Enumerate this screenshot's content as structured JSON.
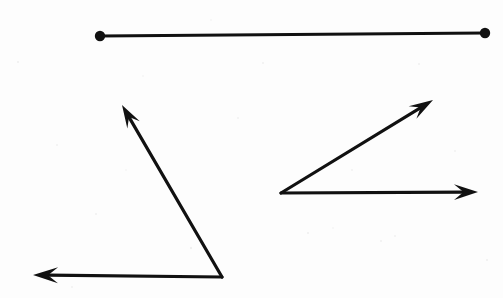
{
  "document": {
    "title": "Geometric figures: one line segment and two angles",
    "background_color": "#fdfdfd",
    "ink_color": "#111111",
    "width": 503,
    "height": 298,
    "stroke_width": 3.2
  },
  "figures": [
    {
      "id": "line-segment",
      "type": "segment",
      "label": "Line segment with two endpoint dots",
      "start": {
        "x": 100,
        "y": 36
      },
      "end": {
        "x": 485,
        "y": 33
      },
      "endpoint_marker": "filled-dot",
      "endpoint_radius": 5.2
    },
    {
      "id": "left-angle",
      "type": "angle",
      "label": "Obtuse angle opening up and to the left",
      "vertex": {
        "x": 222,
        "y": 277
      },
      "rays": [
        {
          "id": "left-angle-ray-up",
          "label": "Ray pointing up and to the left",
          "tip": {
            "x": 122,
            "y": 105
          },
          "marker": "arrowhead"
        },
        {
          "id": "left-angle-ray-horizontal",
          "label": "Ray pointing to the left",
          "tip": {
            "x": 33,
            "y": 275
          },
          "marker": "arrowhead"
        }
      ]
    },
    {
      "id": "right-angle",
      "type": "angle",
      "label": "Acute angle opening up and to the right",
      "vertex": {
        "x": 281,
        "y": 193
      },
      "rays": [
        {
          "id": "right-angle-ray-up",
          "label": "Ray pointing up and to the right",
          "tip": {
            "x": 433,
            "y": 100
          },
          "marker": "arrowhead"
        },
        {
          "id": "right-angle-ray-horizontal",
          "label": "Ray pointing to the right",
          "tip": {
            "x": 478,
            "y": 192
          },
          "marker": "arrowhead"
        }
      ]
    }
  ],
  "speckles": [
    {
      "x": 18,
      "y": 62,
      "r": 1.1
    },
    {
      "x": 57,
      "y": 145,
      "r": 0.9
    },
    {
      "x": 96,
      "y": 214,
      "r": 1.0
    },
    {
      "x": 143,
      "y": 76,
      "r": 0.8
    },
    {
      "x": 191,
      "y": 248,
      "r": 1.2
    },
    {
      "x": 238,
      "y": 118,
      "r": 0.9
    },
    {
      "x": 263,
      "y": 63,
      "r": 1.0
    },
    {
      "x": 308,
      "y": 233,
      "r": 1.1
    },
    {
      "x": 333,
      "y": 228,
      "r": 0.8
    },
    {
      "x": 381,
      "y": 241,
      "r": 1.0
    },
    {
      "x": 395,
      "y": 236,
      "r": 0.9
    },
    {
      "x": 419,
      "y": 64,
      "r": 1.0
    },
    {
      "x": 455,
      "y": 151,
      "r": 0.9
    },
    {
      "x": 487,
      "y": 260,
      "r": 1.1
    },
    {
      "x": 72,
      "y": 287,
      "r": 0.9
    },
    {
      "x": 211,
      "y": 20,
      "r": 0.8
    },
    {
      "x": 352,
      "y": 170,
      "r": 0.9
    },
    {
      "x": 126,
      "y": 170,
      "r": 0.8
    }
  ]
}
